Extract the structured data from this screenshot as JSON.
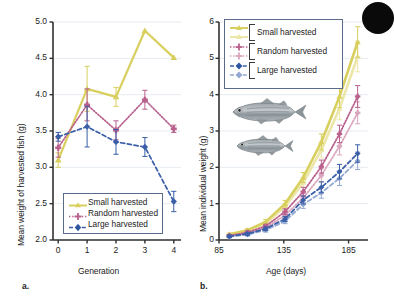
{
  "figure": {
    "panels": [
      {
        "id": "a",
        "label": "a.",
        "xlabel": "Generation",
        "ylabel": "Mean weight of harvested fish (g)",
        "legend": [
          {
            "name": "Small harvested",
            "color": "#d8cf5e",
            "marker": "triangle",
            "line": "solid"
          },
          {
            "name": "Random harvested",
            "color": "#b9608c",
            "marker": "plus",
            "line": "dotted"
          },
          {
            "name": "Large harvested",
            "color": "#3a5fa8",
            "marker": "diamond",
            "line": "dashed"
          }
        ]
      },
      {
        "id": "b",
        "label": "b.",
        "xlabel": "Age (days)",
        "ylabel": "Mean individual weight (g)",
        "legend": [
          {
            "name": "Small harvested",
            "color": "#d8cf5e",
            "color_light": "#ece6a8",
            "marker": "triangle"
          },
          {
            "name": "Random harvested",
            "color": "#b9608c",
            "color_light": "#d9a6be",
            "marker": "plus"
          },
          {
            "name": "Large harvested",
            "color": "#3a5fa8",
            "color_light": "#93a8d2",
            "marker": "diamond"
          }
        ]
      }
    ]
  },
  "chart_data": [
    {
      "type": "line",
      "panel": "a",
      "title": "",
      "xlabel": "Generation",
      "ylabel": "Mean weight of harvested fish (g)",
      "x": [
        0,
        1,
        2,
        3,
        4
      ],
      "xticks": [
        "0",
        "1",
        "2",
        "3",
        "4"
      ],
      "xlim": [
        -0.18,
        4.25
      ],
      "yticks": [
        "2.0",
        "2.5",
        "3.0",
        "3.5",
        "4.0",
        "4.5",
        "5.0"
      ],
      "ylim": [
        2.0,
        5.0
      ],
      "grid": true,
      "legend_position": "lower-left",
      "series": [
        {
          "name": "Small harvested",
          "color": "#d8cf5e",
          "linestyle": "solid",
          "marker": "triangle",
          "values": [
            3.1,
            4.08,
            3.97,
            4.88,
            4.51
          ],
          "errors": [
            0.1,
            0.31,
            0.13,
            0.0,
            0.0
          ]
        },
        {
          "name": "Random harvested",
          "color": "#b9608c",
          "linestyle": "dotted",
          "marker": "plus",
          "values": [
            3.27,
            3.86,
            3.51,
            3.93,
            3.53
          ],
          "errors": [
            0.13,
            0.22,
            0.13,
            0.13,
            0.05
          ]
        },
        {
          "name": "Large harvested",
          "color": "#3a5fa8",
          "linestyle": "dashed",
          "marker": "diamond",
          "values": [
            3.42,
            3.56,
            3.35,
            3.28,
            2.53
          ],
          "errors": [
            0.06,
            0.28,
            0.17,
            0.13,
            0.14
          ]
        }
      ]
    },
    {
      "type": "line",
      "panel": "b",
      "title": "",
      "xlabel": "Age (days)",
      "ylabel": "Mean individual weight (g)",
      "xticks": [
        "85",
        "135",
        "185"
      ],
      "xtickvals": [
        85,
        135,
        185
      ],
      "xlim": [
        85,
        200
      ],
      "yticks": [
        "0",
        "1",
        "2",
        "3",
        "4",
        "5",
        "6"
      ],
      "ylim": [
        0,
        6
      ],
      "grid": true,
      "legend_position": "upper-left",
      "annotations": [
        "large fish illustration",
        "small fish illustration"
      ],
      "series": [
        {
          "name": "Small harvested",
          "color": "#d8cf5e",
          "linestyle": "solid",
          "marker": "triangle",
          "x": [
            93,
            107,
            121,
            136,
            150,
            164,
            178,
            192
          ],
          "values": [
            0.16,
            0.27,
            0.5,
            1.0,
            1.72,
            2.7,
            3.95,
            5.45
          ],
          "errors": [
            0.03,
            0.04,
            0.06,
            0.09,
            0.14,
            0.22,
            0.31,
            0.42
          ]
        },
        {
          "name": "Small harvested (light)",
          "color": "#ece6a8",
          "linestyle": "solid",
          "marker": "triangle",
          "x": [
            93,
            107,
            121,
            136,
            150,
            164,
            178,
            192
          ],
          "values": [
            0.14,
            0.24,
            0.45,
            0.92,
            1.58,
            2.48,
            3.62,
            5.05
          ],
          "errors": [
            0.03,
            0.04,
            0.06,
            0.09,
            0.14,
            0.22,
            0.31,
            0.42
          ]
        },
        {
          "name": "Random harvested",
          "color": "#b9608c",
          "linestyle": "dotted",
          "marker": "plus",
          "x": [
            93,
            107,
            121,
            136,
            150,
            164,
            178,
            192
          ],
          "values": [
            0.12,
            0.21,
            0.38,
            0.78,
            1.33,
            2.02,
            2.92,
            3.95
          ],
          "errors": [
            0.03,
            0.04,
            0.05,
            0.08,
            0.12,
            0.18,
            0.24,
            0.3
          ]
        },
        {
          "name": "Random harvested (light)",
          "color": "#d9a6be",
          "linestyle": "dotted",
          "marker": "plus",
          "x": [
            93,
            107,
            121,
            136,
            150,
            164,
            178,
            192
          ],
          "values": [
            0.11,
            0.18,
            0.33,
            0.68,
            1.16,
            1.78,
            2.58,
            3.5
          ],
          "errors": [
            0.03,
            0.04,
            0.05,
            0.08,
            0.12,
            0.18,
            0.24,
            0.3
          ]
        },
        {
          "name": "Large harvested",
          "color": "#3a5fa8",
          "linestyle": "dashed",
          "marker": "diamond",
          "x": [
            93,
            107,
            121,
            136,
            150,
            164,
            178,
            192
          ],
          "values": [
            0.1,
            0.17,
            0.31,
            0.58,
            1.1,
            1.45,
            1.88,
            2.38
          ],
          "errors": [
            0.03,
            0.04,
            0.05,
            0.07,
            0.11,
            0.15,
            0.2,
            0.24
          ]
        },
        {
          "name": "Large harvested (light)",
          "color": "#93a8d2",
          "linestyle": "dashed",
          "marker": "diamond",
          "x": [
            93,
            107,
            121,
            136,
            150,
            164,
            178,
            192
          ],
          "values": [
            0.09,
            0.15,
            0.27,
            0.52,
            0.98,
            1.3,
            1.7,
            2.18
          ],
          "errors": [
            0.03,
            0.04,
            0.05,
            0.07,
            0.11,
            0.15,
            0.2,
            0.24
          ]
        }
      ]
    }
  ]
}
